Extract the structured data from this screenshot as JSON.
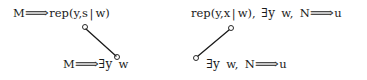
{
  "figure": {
    "background_color": "#ffffff",
    "ink_color": "#1a1a1a",
    "width": 367,
    "height": 80
  },
  "diagrams": [
    {
      "id": "left",
      "top_label": "M ⟹ rep(y,s|w)",
      "bottom_label": "M ⟹ ∃y w",
      "top_parts": {
        "lhs": "M",
        "arrow": "⟹",
        "rhs_head": "rep(y,s",
        "bar": "|",
        "rhs_tail": "w)"
      },
      "bottom_parts": {
        "lhs": "M",
        "arrow": "⟹",
        "quantifier": "∃y",
        "var": "w"
      },
      "edge": {
        "from": "upper-left",
        "to": "lower-right",
        "x1": 86,
        "y1": 29,
        "x2": 116,
        "y2": 56
      }
    },
    {
      "id": "right",
      "top_label": "rep(y,x|w), ∃y w, N ⟹ u",
      "bottom_label": "∃y w, N ⟹ u",
      "top_parts": {
        "rhs_head": "rep(y,x",
        "bar": "|",
        "rhs_tail": "w),",
        "quantifier": "∃y",
        "var": "w,",
        "lhs": "N",
        "arrow": "⟹",
        "result": "u"
      },
      "bottom_parts": {
        "quantifier": "∃y",
        "var": "w,",
        "lhs": "N",
        "arrow": "⟹",
        "result": "u"
      },
      "edge": {
        "from": "lower-left",
        "to": "upper-right",
        "x1": 198,
        "y1": 56,
        "x2": 229,
        "y2": 30
      }
    }
  ],
  "nodes": [
    {
      "name": "left-upper-node",
      "x": 85,
      "y": 27
    },
    {
      "name": "left-lower-node",
      "x": 117,
      "y": 57
    },
    {
      "name": "right-upper-node",
      "x": 231,
      "y": 28
    },
    {
      "name": "right-lower-node",
      "x": 196,
      "y": 58
    }
  ]
}
